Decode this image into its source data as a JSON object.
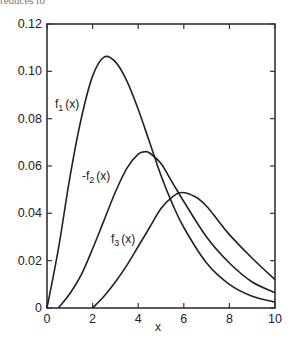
{
  "header_text": "reduces to",
  "chart_data": {
    "type": "line",
    "title": "",
    "xlabel": "x",
    "ylabel": "",
    "xlim": [
      0,
      10
    ],
    "ylim": [
      0,
      0.12
    ],
    "grid": false,
    "legend": "inline labels",
    "x_ticks": [
      "0",
      "2",
      "4",
      "6",
      "8",
      "10"
    ],
    "y_ticks": [
      "0",
      "0.02",
      "0.04",
      "0.06",
      "0.08",
      "0.10",
      "0.12"
    ],
    "series": [
      {
        "name": "f1(x)",
        "label_main": "f",
        "label_sub": "1",
        "label_tail": "(x)",
        "label_pos": [
          55,
          108
        ],
        "points": [
          [
            0,
            0
          ],
          [
            0.5,
            0.025
          ],
          [
            1,
            0.055
          ],
          [
            1.5,
            0.08
          ],
          [
            2,
            0.098
          ],
          [
            2.5,
            0.106
          ],
          [
            3,
            0.104
          ],
          [
            3.5,
            0.096
          ],
          [
            4,
            0.084
          ],
          [
            4.5,
            0.07
          ],
          [
            5,
            0.056
          ],
          [
            5.5,
            0.044
          ],
          [
            6,
            0.034
          ],
          [
            7,
            0.019
          ],
          [
            8,
            0.01
          ],
          [
            9,
            0.005
          ],
          [
            10,
            0.0025
          ]
        ]
      },
      {
        "name": "-f2(x)",
        "label_main": "-f",
        "label_sub": "2",
        "label_tail": "(x)",
        "label_pos": [
          82,
          180
        ],
        "points": [
          [
            0.5,
            0
          ],
          [
            1,
            0.006
          ],
          [
            1.5,
            0.014
          ],
          [
            2,
            0.025
          ],
          [
            2.5,
            0.037
          ],
          [
            3,
            0.049
          ],
          [
            3.5,
            0.059
          ],
          [
            4,
            0.065
          ],
          [
            4.3,
            0.066
          ],
          [
            4.5,
            0.0655
          ],
          [
            5,
            0.061
          ],
          [
            5.5,
            0.053
          ],
          [
            6,
            0.045
          ],
          [
            7,
            0.03
          ],
          [
            8,
            0.019
          ],
          [
            9,
            0.011
          ],
          [
            10,
            0.0065
          ]
        ]
      },
      {
        "name": "f3(x)",
        "label_main": "f",
        "label_sub": "3",
        "label_tail": "(x)",
        "label_pos": [
          111,
          243
        ],
        "points": [
          [
            2,
            0
          ],
          [
            2.5,
            0.005
          ],
          [
            3,
            0.011
          ],
          [
            3.5,
            0.018
          ],
          [
            4,
            0.026
          ],
          [
            4.5,
            0.034
          ],
          [
            5,
            0.042
          ],
          [
            5.5,
            0.047
          ],
          [
            5.9,
            0.0488
          ],
          [
            6.5,
            0.047
          ],
          [
            7,
            0.043
          ],
          [
            7.5,
            0.037
          ],
          [
            8,
            0.031
          ],
          [
            9,
            0.021
          ],
          [
            10,
            0.012
          ]
        ]
      }
    ]
  }
}
